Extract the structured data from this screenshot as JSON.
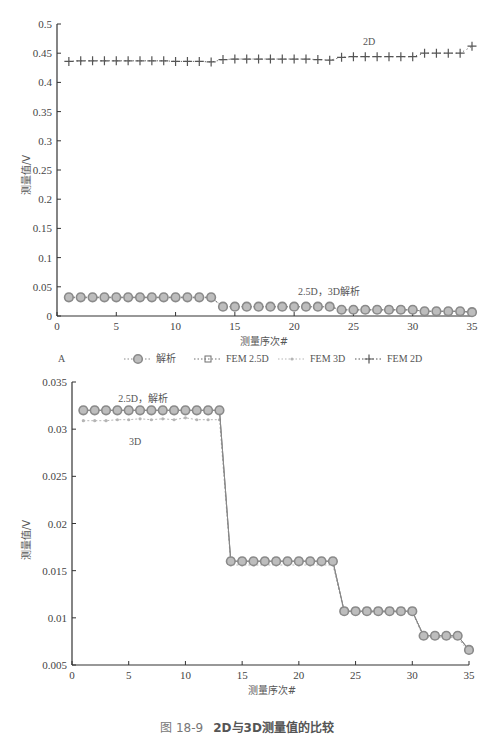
{
  "chart_data": [
    {
      "panel": "A",
      "type": "line",
      "title": "",
      "xlabel": "测量序次#",
      "ylabel": "测量值/V",
      "xlim": [
        0,
        35
      ],
      "ylim": [
        0,
        0.5
      ],
      "x_ticks": [
        0,
        5,
        10,
        15,
        20,
        25,
        30,
        35
      ],
      "y_ticks": [
        0,
        0.05,
        0.1,
        0.15,
        0.2,
        0.25,
        0.3,
        0.35,
        0.4,
        0.45,
        0.5
      ],
      "y_tick_labels": [
        "0",
        "0.05",
        "0.1",
        "0.15",
        "0.2",
        "0.25",
        "0.3",
        "0.35",
        "0.4",
        "0.45",
        "0.5"
      ],
      "grid": false,
      "legend_position": "bottom",
      "annotations": [
        {
          "text": "2D",
          "x": 20.5,
          "y": 0.465
        },
        {
          "text": "2.5D，3D解析",
          "x": 21,
          "y": 0.045
        }
      ],
      "x": [
        1,
        2,
        3,
        4,
        5,
        6,
        7,
        8,
        9,
        10,
        11,
        12,
        13,
        14,
        15,
        16,
        17,
        18,
        19,
        20,
        21,
        22,
        23,
        24,
        25,
        26,
        27,
        28,
        29,
        30,
        31,
        32,
        33,
        34,
        35
      ],
      "series": [
        {
          "name": "解析",
          "marker": "circle",
          "values": [
            0.032,
            0.032,
            0.032,
            0.032,
            0.032,
            0.032,
            0.032,
            0.032,
            0.032,
            0.032,
            0.032,
            0.032,
            0.032,
            0.016,
            0.016,
            0.016,
            0.016,
            0.016,
            0.016,
            0.016,
            0.016,
            0.016,
            0.016,
            0.0107,
            0.0107,
            0.0107,
            0.0107,
            0.0107,
            0.0107,
            0.0107,
            0.008,
            0.008,
            0.008,
            0.008,
            0.0065
          ]
        },
        {
          "name": "FEM 2.5D",
          "marker": "square",
          "values": [
            0.032,
            0.032,
            0.032,
            0.032,
            0.032,
            0.032,
            0.032,
            0.032,
            0.032,
            0.032,
            0.032,
            0.032,
            0.032,
            0.016,
            0.016,
            0.016,
            0.016,
            0.016,
            0.016,
            0.016,
            0.016,
            0.016,
            0.016,
            0.0107,
            0.0107,
            0.0107,
            0.0107,
            0.0107,
            0.0107,
            0.0107,
            0.008,
            0.008,
            0.008,
            0.008,
            0.0065
          ]
        },
        {
          "name": "FEM 3D",
          "marker": "diamond",
          "values": [
            0.031,
            0.031,
            0.031,
            0.031,
            0.031,
            0.031,
            0.031,
            0.031,
            0.031,
            0.031,
            0.031,
            0.031,
            0.031,
            0.0157,
            0.0157,
            0.0157,
            0.0157,
            0.0157,
            0.0157,
            0.0157,
            0.0157,
            0.0157,
            0.0157,
            0.0106,
            0.0106,
            0.0106,
            0.0106,
            0.0106,
            0.0106,
            0.0106,
            0.008,
            0.008,
            0.008,
            0.008,
            0.0064
          ]
        },
        {
          "name": "FEM 2D",
          "marker": "plus",
          "values": [
            0.436,
            0.437,
            0.437,
            0.437,
            0.437,
            0.437,
            0.437,
            0.437,
            0.437,
            0.436,
            0.436,
            0.436,
            0.435,
            0.439,
            0.44,
            0.44,
            0.44,
            0.44,
            0.44,
            0.44,
            0.44,
            0.439,
            0.438,
            0.443,
            0.444,
            0.444,
            0.444,
            0.444,
            0.444,
            0.444,
            0.45,
            0.45,
            0.45,
            0.45,
            0.462
          ]
        }
      ]
    },
    {
      "panel": "B",
      "type": "line",
      "title": "",
      "xlabel": "测量序次#",
      "ylabel": "测量值/V",
      "xlim": [
        0,
        35
      ],
      "ylim": [
        0.005,
        0.035
      ],
      "x_ticks": [
        0,
        5,
        10,
        15,
        20,
        25,
        30,
        35
      ],
      "y_ticks": [
        0.005,
        0.01,
        0.015,
        0.02,
        0.025,
        0.03,
        0.035
      ],
      "y_tick_labels": [
        "0.005",
        "0.01",
        "0.015",
        "0.02",
        "0.025",
        "0.03",
        "0.035"
      ],
      "grid": false,
      "legend_position": "bottom",
      "annotations": [
        {
          "text": "2.5D，解析",
          "x": 5.5,
          "y": 0.0334
        },
        {
          "text": "3D",
          "x": 5.5,
          "y": 0.0293
        }
      ],
      "x": [
        1,
        2,
        3,
        4,
        5,
        6,
        7,
        8,
        9,
        10,
        11,
        12,
        13,
        14,
        15,
        16,
        17,
        18,
        19,
        20,
        21,
        22,
        23,
        24,
        25,
        26,
        27,
        28,
        29,
        30,
        31,
        32,
        33,
        34,
        35
      ],
      "series": [
        {
          "name": "解析",
          "marker": "circle",
          "values": [
            0.032,
            0.032,
            0.032,
            0.032,
            0.032,
            0.032,
            0.032,
            0.032,
            0.032,
            0.032,
            0.032,
            0.032,
            0.032,
            0.016,
            0.016,
            0.016,
            0.016,
            0.016,
            0.016,
            0.016,
            0.016,
            0.016,
            0.016,
            0.0107,
            0.0107,
            0.0107,
            0.0107,
            0.0107,
            0.0107,
            0.0107,
            0.0081,
            0.0081,
            0.0081,
            0.0081,
            0.0066
          ]
        },
        {
          "name": "FEM 2.5D",
          "marker": "square",
          "values": [
            0.032,
            0.032,
            0.032,
            0.032,
            0.032,
            0.032,
            0.032,
            0.032,
            0.032,
            0.032,
            0.032,
            0.032,
            0.032,
            0.016,
            0.016,
            0.016,
            0.016,
            0.016,
            0.016,
            0.016,
            0.016,
            0.016,
            0.016,
            0.0107,
            0.0107,
            0.0107,
            0.0107,
            0.0107,
            0.0107,
            0.0107,
            0.0081,
            0.0081,
            0.0081,
            0.0081,
            0.0066
          ]
        },
        {
          "name": "FEM 3D",
          "marker": "diamond",
          "values": [
            0.0309,
            0.0309,
            0.0309,
            0.031,
            0.031,
            0.0311,
            0.031,
            0.0311,
            0.031,
            0.0312,
            0.031,
            0.031,
            0.031,
            0.0156,
            0.0156,
            0.0156,
            0.0156,
            0.0156,
            0.0156,
            0.0156,
            0.0156,
            0.0156,
            0.0156,
            0.0106,
            0.0106,
            0.0106,
            0.0106,
            0.0106,
            0.0106,
            0.0106,
            0.0079,
            0.0079,
            0.0079,
            0.0079,
            0.0064
          ]
        }
      ]
    }
  ],
  "panels": {
    "a": {
      "label": "A",
      "xlabel": "测量序次#",
      "ylabel": "测量值/V",
      "annotation_2d": "2D",
      "annotation_low": "2.5D，3D解析",
      "legend": [
        "解析",
        "FEM 2.5D",
        "FEM 3D",
        "FEM 2D"
      ]
    },
    "b": {
      "label": "B",
      "xlabel": "测量序次#",
      "ylabel": "测量值/V",
      "annotation_top": "2.5D，解析",
      "annotation_3d": "3D",
      "legend": [
        "解析",
        "FEM 2.5D",
        "FEM 3D"
      ]
    }
  },
  "caption": {
    "number": "图 18-9",
    "text": "2D与3D测量值的比较"
  },
  "colors": {
    "axis": "#333333",
    "analytic": "#8a8a8a",
    "fem25": "#6f6f6f",
    "fem3d": "#b5b5b5",
    "fem2d": "#555555"
  }
}
